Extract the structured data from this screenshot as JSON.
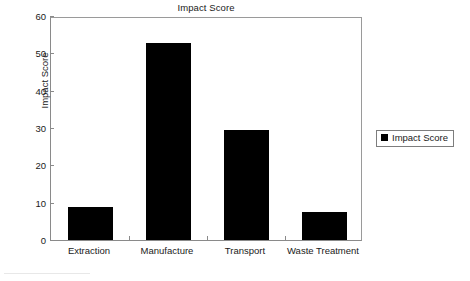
{
  "chart_data": {
    "type": "bar",
    "title": "Impact Score",
    "xlabel": "",
    "ylabel": "Impact Score",
    "categories": [
      "Extraction",
      "Manufacture",
      "Transport",
      "Waste Treatment"
    ],
    "values": [
      8.8,
      52.8,
      29.5,
      7.5
    ],
    "series": [
      {
        "name": "Impact Score",
        "values": [
          8.8,
          52.8,
          29.5,
          7.5
        ],
        "color": "#000000"
      }
    ],
    "ylim": [
      0,
      60
    ],
    "yticks": [
      0,
      10,
      20,
      30,
      40,
      50,
      60
    ],
    "ytick_labels": [
      "0",
      "10",
      "20",
      "30",
      "40",
      "50",
      "60"
    ],
    "grid": false,
    "legend": {
      "position": "right",
      "entries": [
        {
          "label": "Impact Score",
          "color": "#000000",
          "marker": "square"
        }
      ]
    },
    "axis_color": "#8a8a8a",
    "text_color": "#1a1a1a",
    "background": "#ffffff"
  }
}
